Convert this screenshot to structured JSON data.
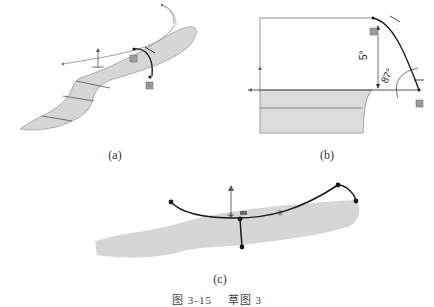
{
  "figure": {
    "panels": [
      {
        "id": "a",
        "label": "(a)"
      },
      {
        "id": "b",
        "label": "(b)",
        "dimensions": {
          "linear": "5°",
          "angle": "87°"
        }
      },
      {
        "id": "c",
        "label": "(c)"
      }
    ],
    "caption": {
      "number": "图 3-15",
      "title": "草图 3"
    },
    "colors": {
      "surface_fill": "#d6d6d6",
      "sketch_line": "#1a1a1a",
      "construction_line": "#8a8a8a"
    }
  }
}
